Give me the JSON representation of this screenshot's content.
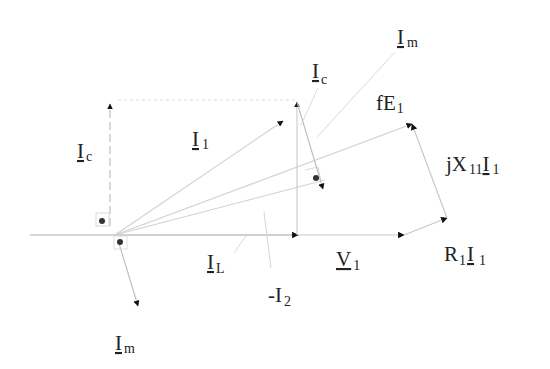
{
  "diagram": {
    "colors": {
      "line": "#c8c8c8",
      "dashed": "#b0b0b0",
      "arrow": "#111111",
      "text": "#222222",
      "dot": "#333333"
    },
    "labels": {
      "ic_left": {
        "main": "I",
        "sub": "c"
      },
      "i1": {
        "main": "I",
        "sub": "1"
      },
      "ic_top": {
        "main": "I",
        "sub": "c"
      },
      "im_top": {
        "main": "I",
        "sub": "m"
      },
      "fe1": {
        "main": "fE",
        "sub": "1"
      },
      "jx11i1": {
        "main1": "jX",
        "sub1": "11",
        "main2": "I",
        "sub2": "1"
      },
      "il": {
        "main": "I",
        "sub": "L"
      },
      "minus_i2": {
        "main": "-I",
        "sub": "2"
      },
      "v1": {
        "main": "V",
        "sub": "1"
      },
      "r1i1": {
        "main1": "R",
        "sub1": "1",
        "main2": "I",
        "sub2": "1"
      },
      "im_bottom": {
        "main": "I",
        "sub": "m"
      }
    },
    "phasors": [
      {
        "name": "I_L",
        "from": [
          115,
          235
        ],
        "to": [
          298,
          235
        ]
      },
      {
        "name": "V_1",
        "from": [
          298,
          235
        ],
        "to": [
          405,
          235
        ]
      },
      {
        "name": "R_1 I_1",
        "from": [
          405,
          235
        ],
        "to": [
          446,
          218
        ]
      },
      {
        "name": "jX_11 I_1",
        "from": [
          446,
          218
        ],
        "to": [
          412,
          124
        ]
      },
      {
        "name": "fE_1",
        "from": [
          115,
          235
        ],
        "to": [
          412,
          124
        ]
      },
      {
        "name": "I_c (left)",
        "from": [
          110,
          235
        ],
        "to": [
          110,
          104
        ]
      },
      {
        "name": "I_c (right)",
        "from": [
          297,
          235
        ],
        "to": [
          297,
          102
        ]
      },
      {
        "name": "I_1",
        "from": [
          115,
          235
        ],
        "to": [
          283,
          118
        ]
      },
      {
        "name": "I_m (right)",
        "from": [
          297,
          102
        ],
        "to": [
          324,
          190
        ]
      },
      {
        "name": "I_m (bottom)",
        "from": [
          118,
          240
        ],
        "to": [
          138,
          306
        ]
      }
    ]
  }
}
